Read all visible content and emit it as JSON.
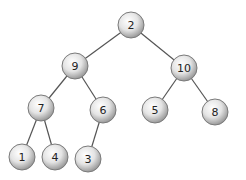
{
  "diagram": {
    "type": "binary-tree",
    "colors": {
      "edge": "#555555",
      "node_fill_light": "#ffffff",
      "node_fill_dark": "#9a9a9a",
      "node_stroke": "#7a7a7a",
      "text": "#222222"
    },
    "nodes": [
      {
        "id": "n2",
        "label": "2",
        "x": 131,
        "y": 25
      },
      {
        "id": "n9",
        "label": "9",
        "x": 75,
        "y": 66
      },
      {
        "id": "n10",
        "label": "10",
        "x": 184,
        "y": 68
      },
      {
        "id": "n7",
        "label": "7",
        "x": 41,
        "y": 108
      },
      {
        "id": "n6",
        "label": "6",
        "x": 103,
        "y": 110
      },
      {
        "id": "n5",
        "label": "5",
        "x": 155,
        "y": 110
      },
      {
        "id": "n8",
        "label": "8",
        "x": 215,
        "y": 112
      },
      {
        "id": "n1",
        "label": "1",
        "x": 22,
        "y": 157
      },
      {
        "id": "n4",
        "label": "4",
        "x": 55,
        "y": 157
      },
      {
        "id": "n3",
        "label": "3",
        "x": 88,
        "y": 159
      }
    ],
    "edges": [
      [
        "n2",
        "n9"
      ],
      [
        "n2",
        "n10"
      ],
      [
        "n9",
        "n7"
      ],
      [
        "n9",
        "n6"
      ],
      [
        "n10",
        "n5"
      ],
      [
        "n10",
        "n8"
      ],
      [
        "n7",
        "n1"
      ],
      [
        "n7",
        "n4"
      ],
      [
        "n6",
        "n3"
      ]
    ]
  }
}
